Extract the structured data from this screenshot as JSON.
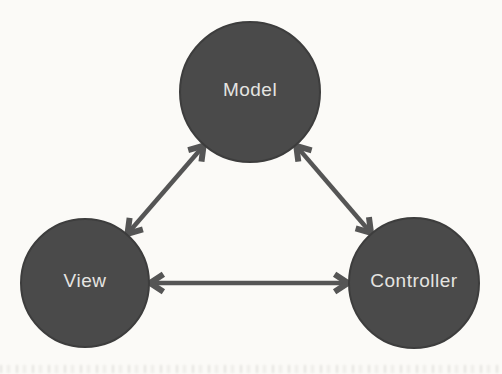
{
  "diagram": {
    "kind": "mvc-pattern-diagram",
    "background_color": "#fbfaf7",
    "node_fill_color": "#4a4a4a",
    "node_stroke_color": "#3d3d3d",
    "label_color": "#e5e4e1",
    "arrow_color": "#555555",
    "nodes": [
      {
        "id": "model",
        "label": "Model",
        "cx": 250,
        "cy": 92,
        "r": 70
      },
      {
        "id": "view",
        "label": "View",
        "cx": 85,
        "cy": 283,
        "r": 64
      },
      {
        "id": "controller",
        "label": "Controller",
        "cx": 414,
        "cy": 283,
        "r": 65
      }
    ],
    "edges": [
      {
        "from": "model",
        "to": "view",
        "type": "double-arrow"
      },
      {
        "from": "model",
        "to": "controller",
        "type": "double-arrow"
      },
      {
        "from": "view",
        "to": "controller",
        "type": "double-arrow"
      }
    ]
  }
}
